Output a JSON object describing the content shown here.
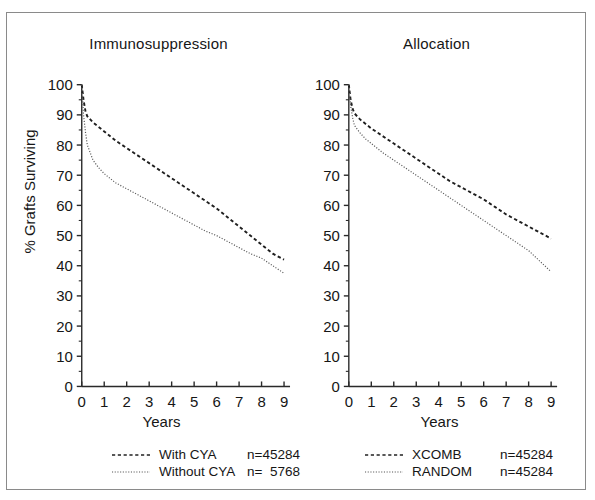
{
  "figure": {
    "y_axis_label": "% Grafts Surviving",
    "x_axis_label_left": "Years",
    "x_axis_label_right": "Years"
  },
  "panels": [
    {
      "key": "immunosuppression",
      "title": "Immunosuppression",
      "legend": [
        {
          "label": "With CYA",
          "n": "n=45284",
          "style": "dashed"
        },
        {
          "label": "Without CYA",
          "n": "n=  5768",
          "style": "dotted"
        }
      ]
    },
    {
      "key": "allocation",
      "title": "Allocation",
      "legend": [
        {
          "label": "XCOMB",
          "n": "n=45284",
          "style": "dashed"
        },
        {
          "label": "RANDOM",
          "n": "n=45284",
          "style": "dotted"
        }
      ]
    }
  ],
  "chart_data": [
    {
      "type": "line",
      "title": "Immunosuppression",
      "xlabel": "Years",
      "ylabel": "% Grafts Surviving",
      "xlim": [
        0,
        9
      ],
      "ylim": [
        0,
        100
      ],
      "xticks": [
        0,
        1,
        2,
        3,
        4,
        5,
        6,
        7,
        8,
        9
      ],
      "yticks": [
        0,
        10,
        20,
        30,
        40,
        50,
        60,
        70,
        80,
        90,
        100
      ],
      "grid": false,
      "legend_position": "below",
      "series": [
        {
          "name": "With CYA",
          "n": 45284,
          "linestyle": "dashed",
          "x": [
            0,
            0.08,
            0.17,
            0.25,
            0.5,
            0.75,
            1,
            1.5,
            2,
            2.5,
            3,
            3.5,
            4,
            4.5,
            5,
            5.5,
            6,
            6.5,
            7,
            7.5,
            8,
            8.5,
            9
          ],
          "y": [
            100,
            95,
            91,
            89.5,
            87.5,
            86,
            84.5,
            81.5,
            79,
            76.5,
            74,
            71.5,
            69,
            66.5,
            64,
            61.5,
            59,
            56,
            53,
            50,
            47,
            44,
            42
          ]
        },
        {
          "name": "Without CYA",
          "n": 5768,
          "linestyle": "dotted",
          "x": [
            0,
            0.08,
            0.17,
            0.25,
            0.5,
            0.75,
            1,
            1.5,
            2,
            2.5,
            3,
            3.5,
            4,
            4.5,
            5,
            5.5,
            6,
            6.5,
            7,
            7.5,
            8,
            8.5,
            9
          ],
          "y": [
            100,
            90,
            84,
            80,
            75,
            72.5,
            70.5,
            67.5,
            65.5,
            63.5,
            61.5,
            59.5,
            57.5,
            55.5,
            53.5,
            51.5,
            50,
            48,
            46,
            44,
            42.5,
            40,
            37.5
          ]
        }
      ]
    },
    {
      "type": "line",
      "title": "Allocation",
      "xlabel": "Years",
      "ylabel": "% Grafts Surviving",
      "xlim": [
        0,
        9
      ],
      "ylim": [
        0,
        100
      ],
      "xticks": [
        0,
        1,
        2,
        3,
        4,
        5,
        6,
        7,
        8,
        9
      ],
      "yticks": [
        0,
        10,
        20,
        30,
        40,
        50,
        60,
        70,
        80,
        90,
        100
      ],
      "grid": false,
      "legend_position": "below",
      "series": [
        {
          "name": "XCOMB",
          "n": 45284,
          "linestyle": "dashed",
          "x": [
            0,
            0.08,
            0.17,
            0.25,
            0.5,
            0.75,
            1,
            1.5,
            2,
            2.5,
            3,
            3.5,
            4,
            4.5,
            5,
            5.5,
            6,
            6.5,
            7,
            7.5,
            8,
            8.5,
            9
          ],
          "y": [
            100,
            95,
            92,
            90.5,
            88.5,
            87,
            85.5,
            83,
            80.5,
            78,
            75.5,
            73,
            70.5,
            68,
            66,
            64,
            62,
            59.5,
            57,
            55,
            53,
            51,
            49
          ]
        },
        {
          "name": "RANDOM",
          "n": 45284,
          "linestyle": "dotted",
          "x": [
            0,
            0.08,
            0.17,
            0.25,
            0.5,
            0.75,
            1,
            1.5,
            2,
            2.5,
            3,
            3.5,
            4,
            4.5,
            5,
            5.5,
            6,
            6.5,
            7,
            7.5,
            8,
            8.5,
            9
          ],
          "y": [
            100,
            93,
            89,
            86.5,
            84,
            82,
            80.5,
            77.5,
            75,
            72.5,
            70,
            67.5,
            65,
            62.5,
            60,
            57.5,
            55,
            52.5,
            50,
            47.5,
            45,
            41.5,
            38
          ]
        }
      ]
    }
  ]
}
